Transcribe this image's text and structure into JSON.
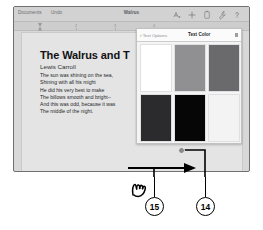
{
  "app": {
    "name": "Pages",
    "document_title": "Walrus"
  },
  "toolbar": {
    "documents_label": "Documents",
    "undo_label": "Undo",
    "title": "Walrus",
    "icons": [
      {
        "name": "format-brush-icon",
        "glyph": "A"
      },
      {
        "name": "insert-plus-icon",
        "glyph": "+"
      },
      {
        "name": "document-tools-icon",
        "glyph": "doc"
      },
      {
        "name": "wrench-icon",
        "glyph": "wrench"
      },
      {
        "name": "help-question-icon",
        "glyph": "?"
      }
    ]
  },
  "ruler": {
    "numbers": [
      "2",
      "3",
      "4"
    ]
  },
  "document": {
    "title": "The Walrus and T",
    "author": "Lewis Carroll",
    "lines": [
      "The sun was shining on the sea,",
      "Shining with all his might",
      "He did his very best to make",
      "The billows smooth and bright--",
      "And this was odd, because it was",
      "The middle of the night."
    ]
  },
  "popover": {
    "back_label": "Text Options",
    "back_chevron": "‹",
    "title": "Text Color",
    "swatches": [
      {
        "name": "swatch-white",
        "color": "#ffffff"
      },
      {
        "name": "swatch-medium-gray",
        "color": "#909092"
      },
      {
        "name": "swatch-dark-gray",
        "color": "#6a6a6c"
      },
      {
        "name": "swatch-charcoal",
        "color": "#2b2b2d"
      },
      {
        "name": "swatch-black",
        "color": "#060607"
      },
      {
        "name": "swatch-off-white",
        "color": "#f3f3f3"
      }
    ]
  },
  "annotations": {
    "callouts": [
      {
        "number": "15",
        "name": "callout-15"
      },
      {
        "number": "14",
        "name": "callout-14"
      }
    ],
    "gesture": "swipe-right-hand-icon",
    "arrow": "swipe-arrow-right"
  },
  "colors": {
    "frame_border": "#6e7072",
    "toolbar_bg": "#d2d2d2",
    "page_bg": "#e4e4e4",
    "popover_bg": "#f4f4f4",
    "annotation_ink": "#000000"
  }
}
